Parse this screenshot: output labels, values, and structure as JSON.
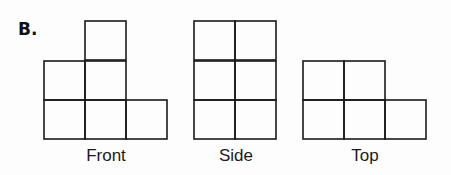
{
  "problem_label": "B.",
  "views": [
    {
      "name": "Front",
      "center_x": 106,
      "cells": [
        [
          85,
          21
        ],
        [
          44,
          61
        ],
        [
          85,
          61
        ],
        [
          44,
          100
        ],
        [
          85,
          100
        ],
        [
          126,
          100
        ]
      ]
    },
    {
      "name": "Side",
      "center_x": 236,
      "cells": [
        [
          194,
          21
        ],
        [
          235,
          21
        ],
        [
          194,
          61
        ],
        [
          235,
          61
        ],
        [
          194,
          100
        ],
        [
          235,
          100
        ]
      ]
    },
    {
      "name": "Top",
      "center_x": 365,
      "cells": [
        [
          303,
          61
        ],
        [
          344,
          61
        ],
        [
          303,
          100
        ],
        [
          344,
          100
        ],
        [
          385,
          100
        ]
      ]
    }
  ],
  "cell_size": {
    "w": 41,
    "h": 39
  },
  "stroke_color": "#1a1a1a"
}
